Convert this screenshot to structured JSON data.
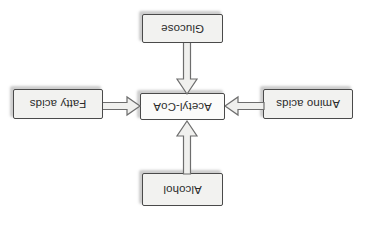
{
  "diagram": {
    "orientation": "rotated-180",
    "background_color": "#ffffff",
    "box_fill_color": "#f2f2f0",
    "box_border_color": "#4a4a4a",
    "text_color": "#2b2b2b",
    "arrow_fill_color": "#f0f0ee",
    "arrow_stroke_color": "#6d6d6d",
    "center": {
      "id": "acetyl-coa",
      "label": "Acetyl-CoA"
    },
    "inputs": [
      {
        "id": "alcohol",
        "label": "Alcohol",
        "position": "top",
        "arrow_direction": "down"
      },
      {
        "id": "amino-acids",
        "label": "Amino acids",
        "position": "left",
        "arrow_direction": "right"
      },
      {
        "id": "fatty-acids",
        "label": "Fatty acids",
        "position": "right",
        "arrow_direction": "left"
      },
      {
        "id": "glucose",
        "label": "Glucose",
        "position": "bottom",
        "arrow_direction": "up"
      }
    ]
  }
}
